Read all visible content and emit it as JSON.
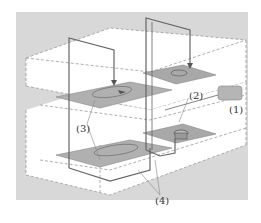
{
  "figure": {
    "type": "isometric technical diagram",
    "colors": {
      "background_panel": "#d6d6d6",
      "box_face": "#ffffff",
      "plate": "#a9a9a9",
      "wire": "#666666",
      "dashed_edge": "#9a9a9a",
      "component": "#b5b5b5"
    },
    "labels": [
      {
        "id": "1",
        "text": "(1)"
      },
      {
        "id": "2",
        "text": "(2)"
      },
      {
        "id": "3",
        "text": "(3)"
      },
      {
        "id": "4",
        "text": "(4)"
      }
    ]
  }
}
